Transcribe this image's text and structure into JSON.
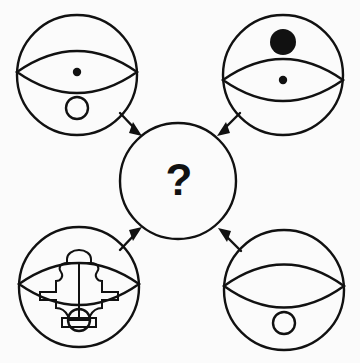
{
  "figure": {
    "type": "visual-analogy-diagram",
    "background_color": "#fbfbfb",
    "ink_color": "#111111",
    "width": 360,
    "height": 363
  },
  "center": {
    "label": "?",
    "name": "unknown-answer",
    "cx": 178,
    "cy": 181,
    "r": 58,
    "stroke_width": 2.4
  },
  "nodes": [
    {
      "id": "top-left",
      "position": "top-left",
      "cx": 77,
      "cy": 75,
      "r": 60,
      "stroke_width": 2.4,
      "eye": {
        "present": true,
        "half_width": 60,
        "half_height": 30,
        "cy_offset": -3
      },
      "pupil": {
        "present": true,
        "size": "small",
        "r": 4.2,
        "cx_offset": 0,
        "cy_offset": -3
      },
      "top_marker": {
        "present": false,
        "r": 0,
        "cy_offset": 0
      },
      "bottom_circle": {
        "present": true,
        "r": 11,
        "cy_offset": 33
      },
      "inner_figure": {
        "present": false
      }
    },
    {
      "id": "top-right",
      "position": "top-right",
      "cx": 283,
      "cy": 75,
      "r": 60,
      "stroke_width": 2.4,
      "eye": {
        "present": true,
        "half_width": 60,
        "half_height": 30,
        "cy_offset": 5
      },
      "pupil": {
        "present": true,
        "size": "small",
        "r": 4.2,
        "cx_offset": 0,
        "cy_offset": 5
      },
      "top_marker": {
        "present": true,
        "r": 13,
        "cx_offset": 0,
        "cy_offset": -33
      },
      "bottom_circle": {
        "present": false,
        "r": 0,
        "cy_offset": 0
      },
      "inner_figure": {
        "present": false
      }
    },
    {
      "id": "bottom-left",
      "position": "bottom-left",
      "cx": 79,
      "cy": 287,
      "r": 60,
      "stroke_width": 2.4,
      "eye": {
        "present": true,
        "half_width": 60,
        "half_height": 30,
        "cy_offset": -3
      },
      "pupil": {
        "present": false,
        "r": 0,
        "cx_offset": 0,
        "cy_offset": 0
      },
      "top_marker": {
        "present": false,
        "r": 0,
        "cy_offset": 0
      },
      "bottom_circle": {
        "present": true,
        "r": 11,
        "cy_offset": 33
      },
      "inner_figure": {
        "present": true,
        "shape": "anvil-puzzle-figure",
        "description": "interlocking puzzle / anvil silhouette with dome cap on top and rectangular base"
      }
    },
    {
      "id": "bottom-right",
      "position": "bottom-right",
      "cx": 284,
      "cy": 290,
      "r": 60,
      "stroke_width": 2.4,
      "eye": {
        "present": true,
        "half_width": 60,
        "half_height": 31,
        "cy_offset": -4
      },
      "pupil": {
        "present": false,
        "r": 0,
        "cx_offset": 0,
        "cy_offset": 0
      },
      "top_marker": {
        "present": false,
        "r": 0,
        "cy_offset": 0
      },
      "bottom_circle": {
        "present": true,
        "r": 11,
        "cy_offset": 33
      },
      "inner_figure": {
        "present": false
      }
    }
  ],
  "arrows": [
    {
      "id": "arrow-top-left-to-center",
      "from": "top-left",
      "to": "center",
      "x1": 120,
      "y1": 113,
      "x2": 140,
      "y2": 134,
      "direction": "down-right"
    },
    {
      "id": "arrow-top-right-to-center",
      "from": "top-right",
      "to": "center",
      "x1": 240,
      "y1": 113,
      "x2": 219,
      "y2": 134,
      "direction": "down-left"
    },
    {
      "id": "arrow-bottom-left-to-center",
      "from": "bottom-left",
      "to": "center",
      "x1": 120,
      "y1": 250,
      "x2": 140,
      "y2": 229,
      "direction": "up-right"
    },
    {
      "id": "arrow-bottom-right-to-center",
      "from": "bottom-right",
      "to": "center",
      "x1": 241,
      "y1": 251,
      "x2": 220,
      "y2": 230,
      "direction": "up-left"
    }
  ]
}
